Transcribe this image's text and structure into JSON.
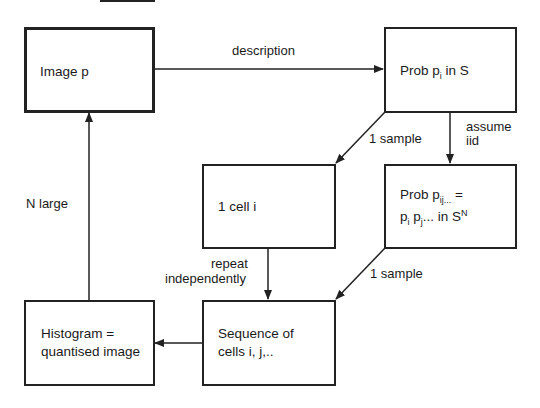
{
  "diagram": {
    "type": "flowchart",
    "nodes": [
      {
        "id": "image",
        "text": "Image p"
      },
      {
        "id": "prob_s",
        "text_main": "Prob p",
        "text_sub": "i",
        "text_tail": " in S"
      },
      {
        "id": "cell",
        "text": "1 cell i"
      },
      {
        "id": "prob_sn",
        "line1_main": "Prob p",
        "line1_sub": "ij...",
        "line1_tail": " =",
        "line2_a": "p",
        "line2_a_sub": "i",
        "line2_b": " p",
        "line2_b_sub": "j",
        "line2_tail": "... in S",
        "line2_sup": "N"
      },
      {
        "id": "histogram",
        "line1": "Histogram =",
        "line2": "quantised image"
      },
      {
        "id": "sequence",
        "line1": "Sequence of",
        "line2": "cells i, j,.."
      }
    ],
    "edges": [
      {
        "from": "image",
        "to": "prob_s",
        "label": "description"
      },
      {
        "from": "prob_s",
        "to": "cell",
        "label": "1 sample"
      },
      {
        "from": "prob_s",
        "to": "prob_sn",
        "label_line1": "assume",
        "label_line2": "iid"
      },
      {
        "from": "cell",
        "to": "sequence",
        "label_line1": "repeat",
        "label_line2": "independently"
      },
      {
        "from": "prob_sn",
        "to": "sequence",
        "label": "1 sample"
      },
      {
        "from": "sequence",
        "to": "histogram",
        "label": ""
      },
      {
        "from": "histogram",
        "to": "image",
        "label": "N large"
      }
    ]
  }
}
